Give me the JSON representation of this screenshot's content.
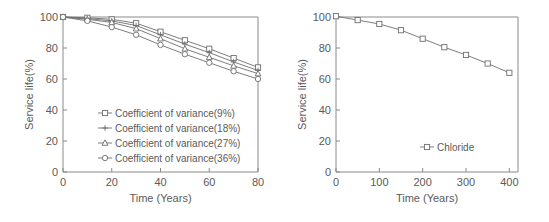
{
  "figure": {
    "background": "#ffffff",
    "line_color": "#6e6e6e",
    "text_color": "#5a5a5a"
  },
  "chart_data": [
    {
      "type": "line",
      "panel": "left",
      "title": "",
      "xlabel": "Time (Years)",
      "ylabel": "Service life(%)",
      "xlim": [
        0,
        80
      ],
      "ylim": [
        0,
        100
      ],
      "xticks": [
        0,
        20,
        40,
        60,
        80
      ],
      "yticks": [
        0,
        20,
        40,
        60,
        80,
        100
      ],
      "xticklabels": [
        "0",
        "20",
        "40",
        "60",
        "80"
      ],
      "yticklabels": [
        "0",
        "20",
        "40",
        "60",
        "80",
        "100"
      ],
      "grid": false,
      "legend_position": "center",
      "x": [
        0,
        10,
        20,
        30,
        40,
        50,
        60,
        70,
        80
      ],
      "series": [
        {
          "name": "Coefficient of variance(9%)",
          "marker": "square",
          "values": [
            100,
            99.5,
            98.5,
            96,
            90.5,
            85,
            79.5,
            73.5,
            67.5
          ]
        },
        {
          "name": "Coefficient of variance(18%)",
          "marker": "cross",
          "values": [
            100,
            99,
            97.5,
            94.5,
            88.5,
            82.5,
            77,
            71,
            65.5
          ]
        },
        {
          "name": "Coefficient of variance(27%)",
          "marker": "triangle",
          "values": [
            100,
            98.5,
            96.5,
            92.5,
            86,
            79.5,
            74,
            68.5,
            63.5
          ]
        },
        {
          "name": "Coefficient of variance(36%)",
          "marker": "circle",
          "values": [
            100,
            97.5,
            93.5,
            88.5,
            82,
            76,
            70.5,
            65,
            60
          ]
        }
      ]
    },
    {
      "type": "line",
      "panel": "right",
      "title": "",
      "xlabel": "Time (Years)",
      "ylabel": "Service life(%)",
      "xlim": [
        0,
        420
      ],
      "ylim": [
        0,
        100
      ],
      "xticks": [
        0,
        100,
        200,
        300,
        400
      ],
      "yticks": [
        0,
        20,
        40,
        60,
        80,
        100
      ],
      "xticklabels": [
        "0",
        "100",
        "200",
        "300",
        "400"
      ],
      "yticklabels": [
        "0",
        "20",
        "40",
        "60",
        "80",
        "100"
      ],
      "grid": false,
      "legend_position": "bottom-right",
      "x": [
        0,
        50,
        100,
        150,
        200,
        250,
        300,
        350,
        400
      ],
      "series": [
        {
          "name": "Chloride",
          "marker": "square",
          "values": [
            100.5,
            98,
            95.5,
            91.5,
            86,
            80.5,
            75.5,
            70,
            64
          ]
        }
      ]
    }
  ]
}
